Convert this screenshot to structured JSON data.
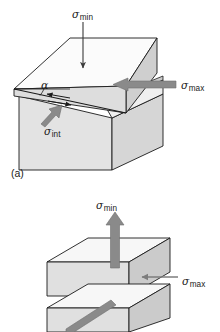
{
  "figure": {
    "background_color": "#ffffff",
    "line_color": "#1a1a1a",
    "arrow_gray": "#858585",
    "face_colors": {
      "top": "#fbfbfb",
      "front": "#e3e3e3",
      "side": "#cfcfcf",
      "inner": "#f2f2f2"
    },
    "symbols": {
      "sigma": "σ",
      "alpha": "α"
    }
  },
  "panels": [
    {
      "tag": "(a)",
      "name": "shear-block-panel",
      "labels": {
        "sigma_min": {
          "symbol": "σ",
          "subscript": "min",
          "arrow": "down",
          "arrow_style": "thin"
        },
        "sigma_max": {
          "symbol": "σ",
          "subscript": "max",
          "arrow": "left",
          "arrow_style": "thick-gray"
        },
        "sigma_int": {
          "symbol": "σ",
          "subscript": "int",
          "arrow": "up-right",
          "arrow_style": "gray"
        },
        "alpha": {
          "symbol": "α",
          "meaning": "shear-plane-angle"
        },
        "shear_arrows": {
          "count": 2,
          "direction": "double-opposed",
          "style": "thin-barbed"
        }
      }
    },
    {
      "tag": "(b)",
      "name": "tensile-block-panel",
      "labels": {
        "sigma_min": {
          "symbol": "σ",
          "subscript": "min",
          "arrow": "up",
          "arrow_style": "thick-gray"
        },
        "sigma_max": {
          "symbol": "σ",
          "subscript": "max",
          "arrow": "left",
          "arrow_style": "thin-gray"
        },
        "diagonal_arrow": {
          "direction": "down-left",
          "style": "thick-gray"
        }
      }
    }
  ]
}
